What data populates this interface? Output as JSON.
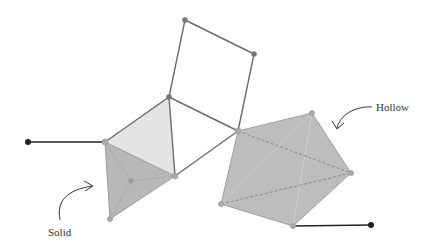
{
  "labels": {
    "solid": "Solid",
    "hollow": "Hollow"
  },
  "colors": {
    "edge": "#6b6b6b",
    "vertex": "#777777",
    "light_face": "#e4e4e4",
    "solid_fill": "#b8b8b8",
    "hollow_fill": "#bdbdbd",
    "dashed_edge": "#8a8a8a",
    "anchor": "#222222"
  },
  "vertices": {
    "top_a": [
      185,
      20
    ],
    "top_b": [
      254,
      54
    ],
    "mid_top": [
      169,
      97
    ],
    "left": [
      105,
      142
    ],
    "mid_bottom": [
      175,
      176
    ],
    "hub": [
      238,
      131
    ],
    "solid_bottom": [
      110,
      219
    ],
    "solid_inner": [
      131,
      181
    ],
    "hollow_top": [
      312,
      113
    ],
    "hollow_right": [
      351,
      173
    ],
    "hollow_bottom": [
      293,
      226
    ],
    "hollow_left": [
      221,
      204
    ],
    "anchor_left": [
      28,
      142
    ],
    "anchor_right": [
      371,
      225
    ]
  }
}
